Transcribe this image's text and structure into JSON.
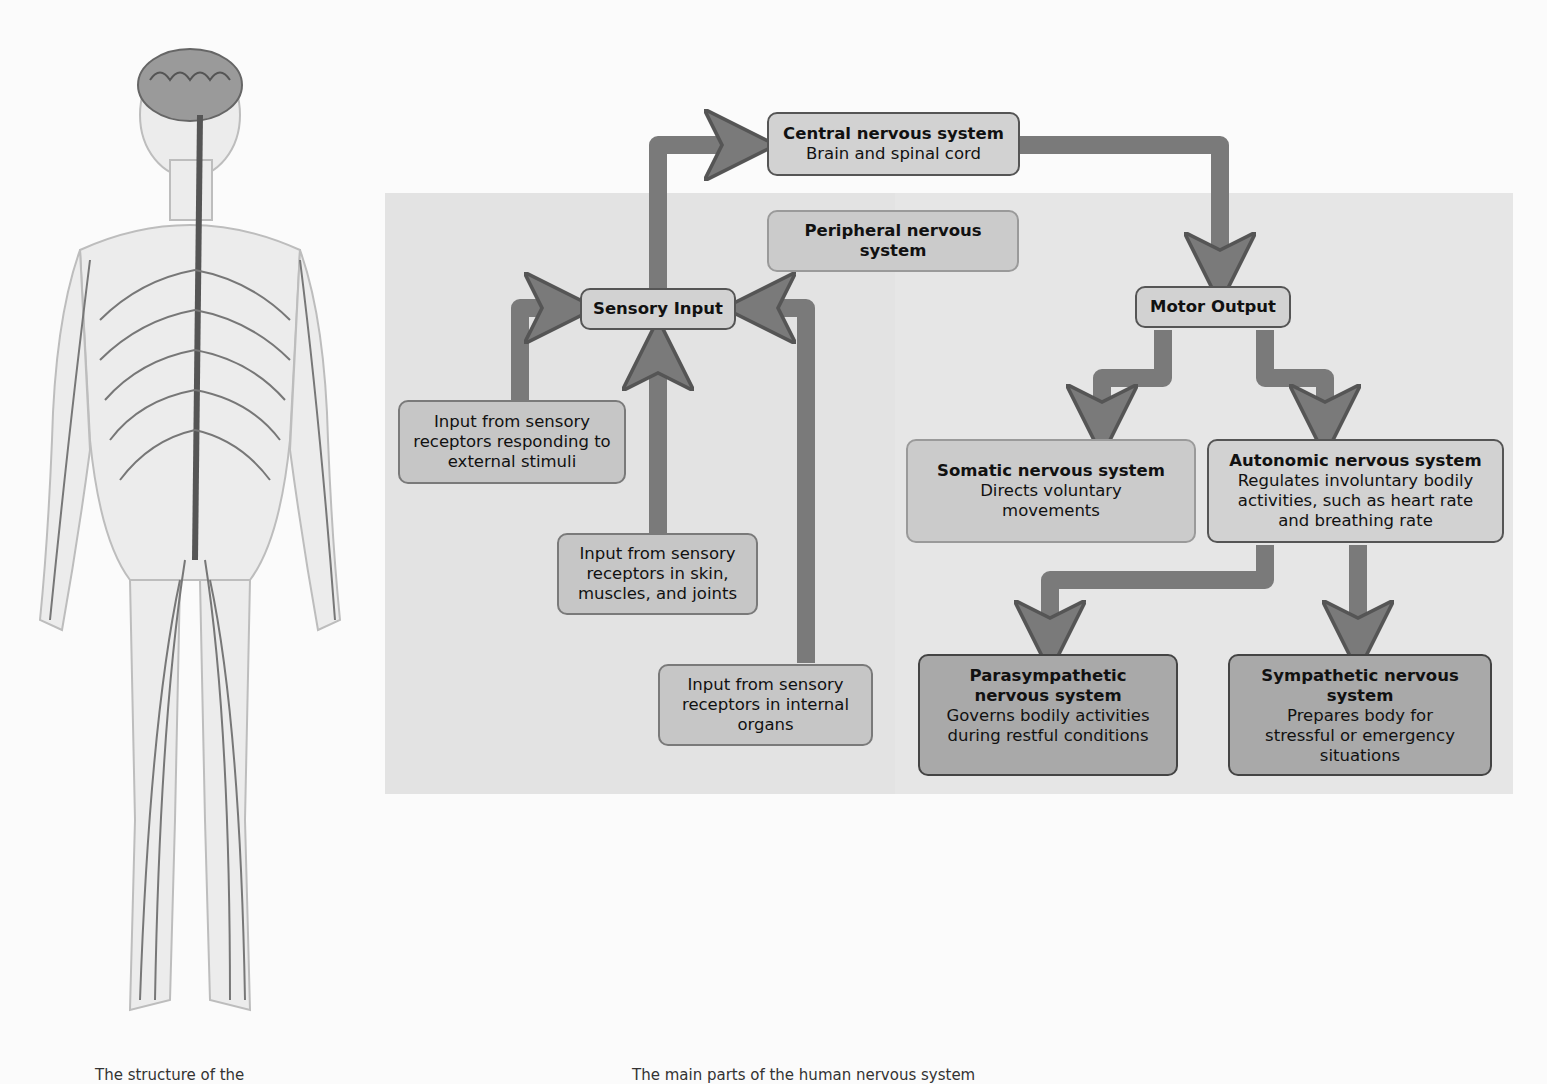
{
  "figure": {
    "illustration": "human-nervous-system-illustration",
    "caption_left": "The structure of the",
    "caption_right": "The main parts of the human nervous system"
  },
  "diagram": {
    "colors": {
      "panel": "#e3e3e3",
      "arrow": "#7a7a7a",
      "box_light": "#d2d2d2",
      "box_dark": "#a9a9a9",
      "border": "#555555"
    },
    "nodes": {
      "cns": {
        "title": "Central nervous system",
        "subtitle": "Brain and spinal cord"
      },
      "pns": {
        "title": "Peripheral nervous system"
      },
      "sensory_input": {
        "title": "Sensory Input"
      },
      "motor_output": {
        "title": "Motor Output"
      },
      "input_external": {
        "text": "Input from sensory receptors responding to external stimuli"
      },
      "input_skin": {
        "text": "Input from sensory receptors in skin, muscles, and joints"
      },
      "input_organs": {
        "text": "Input from sensory receptors in internal organs"
      },
      "somatic": {
        "title": "Somatic nervous system",
        "subtitle": "Directs voluntary movements"
      },
      "autonomic": {
        "title": "Autonomic nervous system",
        "subtitle": "Regulates involuntary bodily activities, such as heart rate and breathing rate"
      },
      "parasympathetic": {
        "title": "Parasympathetic nervous system",
        "subtitle": "Governs bodily activities during restful conditions"
      },
      "sympathetic": {
        "title": "Sympathetic nervous system",
        "subtitle": "Prepares body for stressful or emergency situations"
      }
    },
    "edges": [
      {
        "from": "input_external",
        "to": "sensory_input"
      },
      {
        "from": "input_skin",
        "to": "sensory_input"
      },
      {
        "from": "input_organs",
        "to": "sensory_input"
      },
      {
        "from": "sensory_input",
        "to": "cns"
      },
      {
        "from": "cns",
        "to": "motor_output"
      },
      {
        "from": "motor_output",
        "to": "somatic"
      },
      {
        "from": "motor_output",
        "to": "autonomic"
      },
      {
        "from": "autonomic",
        "to": "parasympathetic"
      },
      {
        "from": "autonomic",
        "to": "sympathetic"
      }
    ]
  }
}
